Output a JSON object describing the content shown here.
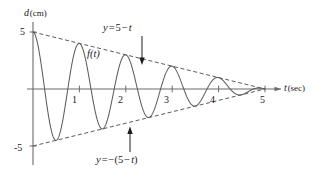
{
  "figure": {
    "background_color": "#ffffff",
    "line_color": "#5c5c5c",
    "axis_color": "#6b6b6b",
    "text_color": "#1a1a1a"
  },
  "axes": {
    "y_axis": {
      "name": "d",
      "unit": "(cm)",
      "label": "d (cm)",
      "ticks": [
        {
          "id": "y5",
          "value": 5,
          "label": "5"
        },
        {
          "id": "ym5",
          "value": -5,
          "label": "-5"
        }
      ],
      "range": [
        -5.6,
        5.6
      ]
    },
    "x_axis": {
      "name": "t",
      "unit": "(sec)",
      "label": "t (sec)",
      "ticks": [
        {
          "id": "x1",
          "value": 1,
          "label": "1"
        },
        {
          "id": "x2",
          "value": 2,
          "label": "2"
        },
        {
          "id": "x3",
          "value": 3,
          "label": "3"
        },
        {
          "id": "x4",
          "value": 4,
          "label": "4"
        },
        {
          "id": "x5",
          "value": 5,
          "label": "5"
        }
      ],
      "range": [
        0,
        5.6
      ]
    }
  },
  "annotations": {
    "curve_label": {
      "text": "f(t)",
      "fn": "f",
      "arg": "(t)"
    },
    "upper_envelope_label": {
      "text": "y = 5 - t",
      "lhs": "y",
      "equals": "=",
      "rhs_a": "5",
      "minus": "−",
      "rhs_b": "t",
      "has_arrow": true,
      "arrow_direction": "down"
    },
    "lower_envelope_label": {
      "text": "y = -(5 - t)",
      "lhs": "y",
      "equals": "=",
      "neg": "−(",
      "rhs_a": "5",
      "minus": "−",
      "rhs_b": "t",
      "close": ")",
      "has_arrow": true,
      "arrow_direction": "up"
    }
  },
  "chart_data": {
    "type": "line",
    "title": "",
    "subtitle": "",
    "xlabel": "t (sec)",
    "ylabel": "d (cm)",
    "xlim": [
      0,
      5.6
    ],
    "ylim": [
      -5.6,
      5.6
    ],
    "grid": false,
    "legend": false,
    "legend_position": "none",
    "xticks": [
      1,
      2,
      3,
      4,
      5
    ],
    "xticklabels": [
      "1",
      "2",
      "3",
      "4",
      "5"
    ],
    "yticks": [
      5,
      -5
    ],
    "yticklabels": [
      "5",
      "-5"
    ],
    "series": [
      {
        "name": "f(t)",
        "style": "solid",
        "color": "#5c5c5c",
        "formula": "(5 - t) * cos(2*pi*t)",
        "description": "damped cosine oscillation, amplitude decays linearly from 5 at t=0 to 0 at t=5, period 1 sec",
        "amplitude_at_t0": 5,
        "period": 1,
        "decay_to_zero_at": 5,
        "x": [
          0,
          0.25,
          0.5,
          0.75,
          1,
          1.25,
          1.5,
          1.75,
          2,
          2.25,
          2.5,
          2.75,
          3,
          3.25,
          3.5,
          3.75,
          4,
          4.25,
          4.5,
          4.75,
          5
        ],
        "y": [
          5,
          0,
          -4.5,
          0,
          4,
          0,
          -3.5,
          0,
          3,
          0,
          -2.5,
          0,
          2,
          0,
          -1.5,
          0,
          1,
          0,
          -0.5,
          0,
          0
        ]
      },
      {
        "name": "y = 5 - t",
        "style": "dashed",
        "color": "#5c5c5c",
        "formula": "5 - t",
        "description": "upper linear envelope",
        "x": [
          0,
          5
        ],
        "y": [
          5,
          0
        ]
      },
      {
        "name": "y = -(5 - t)",
        "style": "dashed",
        "color": "#5c5c5c",
        "formula": "-(5 - t)",
        "description": "lower linear envelope",
        "x": [
          0,
          5
        ],
        "y": [
          -5,
          0
        ]
      }
    ],
    "annotations": [
      {
        "text": "f(t)",
        "x": 1.35,
        "y": 3.2
      },
      {
        "text": "y = 5 - t",
        "x": 2.1,
        "y": 5.3,
        "arrow_to_x": 2.35,
        "arrow_to_y": 2.65
      },
      {
        "text": "y = -(5 - t)",
        "x": 1.95,
        "y": -5.5,
        "arrow_to_x": 2.0,
        "arrow_to_y": -3.0
      }
    ]
  }
}
